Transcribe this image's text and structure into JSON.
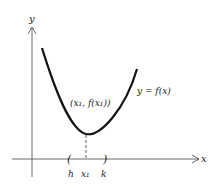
{
  "diagram": {
    "axes": {
      "x_label": "x",
      "y_label": "y"
    },
    "curve_label": "y = f(x)",
    "point_label": "(x₁, f(x₁))",
    "interval": {
      "left_label": "h",
      "center_label": "x₁",
      "right_label": "k",
      "left_bracket": "(",
      "right_bracket": ")"
    },
    "colors": {
      "ink": "#222222",
      "background": "#ffffff"
    }
  }
}
